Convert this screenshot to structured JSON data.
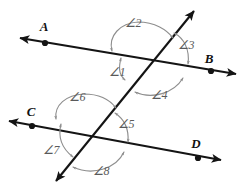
{
  "figure": {
    "type": "geometry-diagram",
    "background_color": "#ffffff",
    "line_color": "#141414",
    "arc_color": "#8e8e8e",
    "label_color": "#111111",
    "angle_label_color": "#5a5a5a",
    "points": [
      {
        "name": "A",
        "label": "A",
        "x": 45,
        "y": 43,
        "label_x": 44,
        "label_y": 31
      },
      {
        "name": "B",
        "label": "B",
        "x": 211,
        "y": 71,
        "label_x": 209,
        "label_y": 63
      },
      {
        "name": "C",
        "label": "C",
        "x": 32,
        "y": 126,
        "label_x": 31,
        "label_y": 116
      },
      {
        "name": "D",
        "label": "D",
        "x": 198,
        "y": 158,
        "label_x": 196,
        "label_y": 148
      }
    ],
    "lines": [
      {
        "name": "line-ab",
        "label": "AB",
        "x1": 20,
        "y1": 38,
        "x2": 236,
        "y2": 74,
        "arrow_start": true,
        "arrow_end": true
      },
      {
        "name": "line-cd",
        "label": "CD",
        "x1": 9,
        "y1": 121,
        "x2": 221,
        "y2": 160,
        "arrow_start": true,
        "arrow_end": true
      },
      {
        "name": "transversal",
        "label": "transversal",
        "x1": 194,
        "y1": 11,
        "x2": 56,
        "y2": 181,
        "arrow_start": true,
        "arrow_end": true
      }
    ],
    "intersections": [
      {
        "name": "upper-intersection",
        "x": 148,
        "y": 60
      },
      {
        "name": "lower-intersection",
        "x": 90,
        "y": 140
      }
    ],
    "angles": [
      {
        "id": 1,
        "label": "∠1",
        "label_x": 117,
        "label_y": 76,
        "vertex": "upper-intersection"
      },
      {
        "id": 2,
        "label": "∠2",
        "label_x": 133,
        "label_y": 27,
        "vertex": "upper-intersection"
      },
      {
        "id": 3,
        "label": "∠3",
        "label_x": 186,
        "label_y": 49,
        "vertex": "upper-intersection"
      },
      {
        "id": 4,
        "label": "∠4",
        "label_x": 159,
        "label_y": 99,
        "vertex": "upper-intersection"
      },
      {
        "id": 5,
        "label": "∠5",
        "label_x": 126,
        "label_y": 128,
        "vertex": "lower-intersection"
      },
      {
        "id": 6,
        "label": "∠6",
        "label_x": 77,
        "label_y": 101,
        "vertex": "lower-intersection"
      },
      {
        "id": 7,
        "label": "∠7",
        "label_x": 51,
        "label_y": 154,
        "vertex": "lower-intersection"
      },
      {
        "id": 8,
        "label": "∠8",
        "label_x": 101,
        "label_y": 175,
        "vertex": "lower-intersection"
      }
    ]
  }
}
